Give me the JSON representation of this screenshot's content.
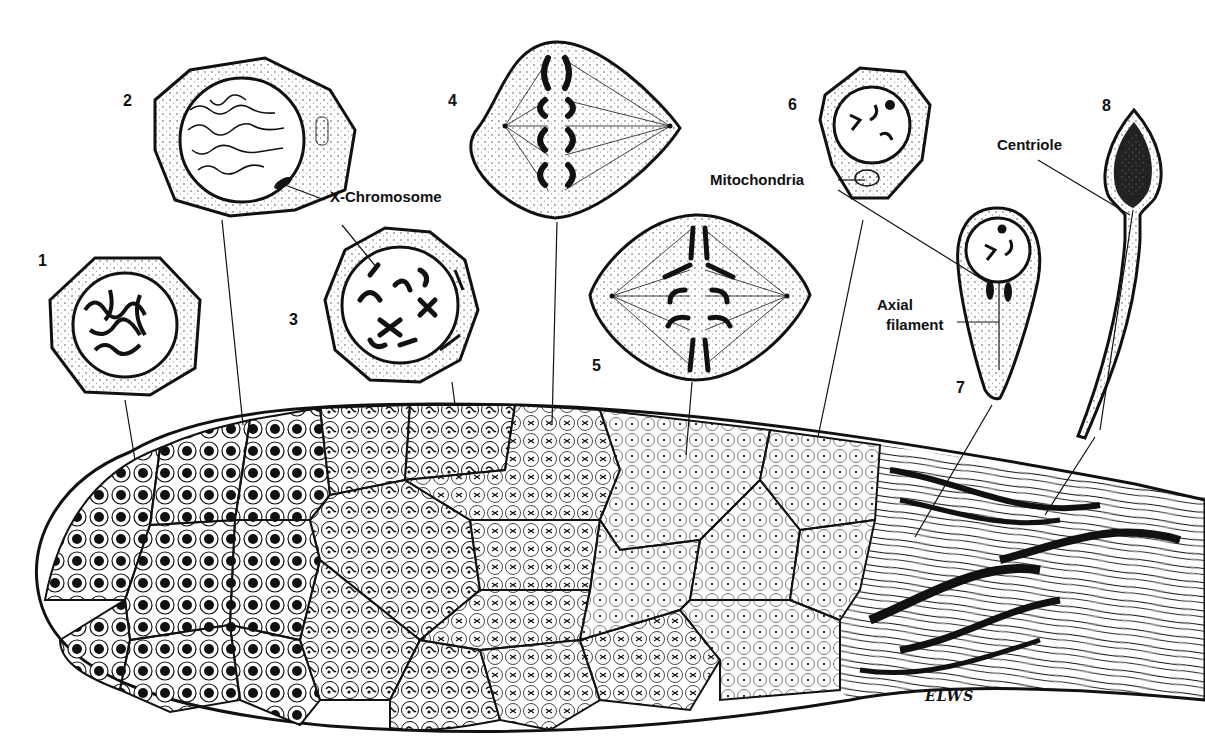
{
  "figure": {
    "stages": [
      {
        "number": "1",
        "x": 38,
        "y": 253
      },
      {
        "number": "2",
        "x": 123,
        "y": 93
      },
      {
        "number": "3",
        "x": 289,
        "y": 312
      },
      {
        "number": "4",
        "x": 448,
        "y": 93
      },
      {
        "number": "5",
        "x": 592,
        "y": 358
      },
      {
        "number": "6",
        "x": 788,
        "y": 97
      },
      {
        "number": "7",
        "x": 956,
        "y": 380
      },
      {
        "number": "8",
        "x": 1102,
        "y": 98
      }
    ],
    "labels": {
      "x_chromosome": "X-Chromosome",
      "mitochondria": "Mitochondria",
      "centriole": "Centriole",
      "axial_line1": "Axial",
      "axial_line2": "filament"
    },
    "signature": "ELWS",
    "colors": {
      "ink": "#111111",
      "paper": "#ffffff",
      "stipple": "#555555"
    }
  }
}
